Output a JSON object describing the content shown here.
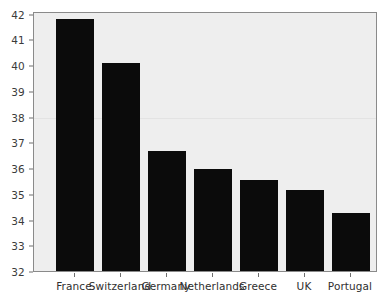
{
  "chart_data": {
    "type": "bar",
    "title": "",
    "subtitle": "",
    "xlabel": "",
    "ylabel": "",
    "categories": [
      "France",
      "Switzerland",
      "Germany",
      "Netherlands",
      "Greece",
      "UK",
      "Portugal"
    ],
    "values": [
      41.8,
      40.1,
      36.65,
      35.95,
      35.55,
      35.15,
      34.25
    ],
    "series": [
      {
        "name": "",
        "values": [
          41.8,
          40.1,
          36.65,
          35.95,
          35.55,
          35.15,
          34.25
        ]
      }
    ],
    "ylim": [
      32,
      42.1
    ],
    "yticks": [
      32,
      33,
      34,
      35,
      36,
      37,
      38,
      39,
      40,
      41,
      42
    ],
    "ytick_labels": [
      "32",
      "33",
      "34",
      "35",
      "36",
      "37",
      "38",
      "39",
      "40",
      "41",
      "42"
    ],
    "xtick_labels": [
      "France",
      "Switzerland",
      "Germany",
      "Netherlands",
      "Greece",
      "UK",
      "Portugal"
    ],
    "grid": "faint-horizontal-at-38",
    "gridlines": [
      38
    ],
    "legend": null,
    "legend_position": "none",
    "annotations": [],
    "bar_color": "#0b0b0b",
    "plot_background": "#eeeeee",
    "frame_color": "#8a8a8a",
    "axis_text_color": "#2f2f2f"
  }
}
